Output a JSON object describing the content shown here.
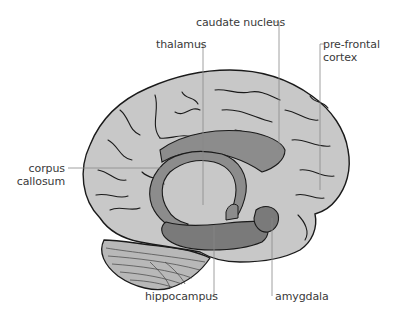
{
  "diagram": {
    "colors": {
      "cortex_fill": "#c8c8c8",
      "limbic_fill": "#8c8c8c",
      "limbic_dark": "#7a7a7a",
      "cerebellum_fill": "#b8b8b8",
      "outline": "#1a1a1a",
      "leader_line": "#888888",
      "label_text": "#3a3a3a"
    },
    "labels": {
      "caudate_nucleus": "caudate nucleus",
      "thalamus": "thalamus",
      "prefrontal_line1": "pre-frontal",
      "prefrontal_line2": "cortex",
      "corpus_line1": "corpus",
      "corpus_line2": "callosum",
      "hippocampus": "hippocampus",
      "amygdala": "amygdala"
    }
  }
}
